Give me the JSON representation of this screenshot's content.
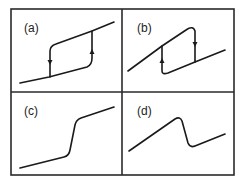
{
  "figure": {
    "colors": {
      "stroke": "#1a1a1a",
      "frame": "#2a2a2a",
      "background": "#ffffff"
    },
    "panels": [
      {
        "id": "a",
        "label": "(a)",
        "shape": "hysteresis loop, rising branch on right (up arrow), falling branch on left (down arrow)"
      },
      {
        "id": "b",
        "label": "(b)",
        "shape": "S-shaped hysteresis, up arrow on left branch, down arrow on right branch"
      },
      {
        "id": "c",
        "label": "(c)",
        "shape": "monotonic curve with steep rise in middle"
      },
      {
        "id": "d",
        "label": "(d)",
        "shape": "rise, sharp drop, then rise again"
      }
    ]
  }
}
